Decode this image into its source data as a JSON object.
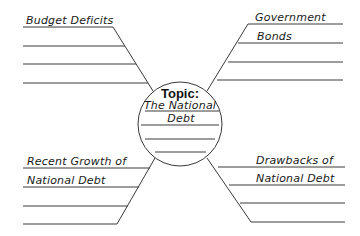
{
  "diagram": {
    "type": "spider-map graphic organizer",
    "center": {
      "heading": "Topic:",
      "title_lines": [
        "The National",
        "Debt"
      ]
    },
    "branches": [
      {
        "position": "top-left",
        "label_lines": [
          "Budget Deficits"
        ]
      },
      {
        "position": "top-right",
        "label_lines": [
          "Government",
          "Bonds"
        ]
      },
      {
        "position": "bottom-left",
        "label_lines": [
          "Recent Growth of",
          "National Debt"
        ]
      },
      {
        "position": "bottom-right",
        "label_lines": [
          "Drawbacks of",
          "National Debt"
        ]
      }
    ],
    "colors": {
      "line": "#3a3a3a",
      "text": "#1a1a1a",
      "background": "#ffffff"
    }
  }
}
